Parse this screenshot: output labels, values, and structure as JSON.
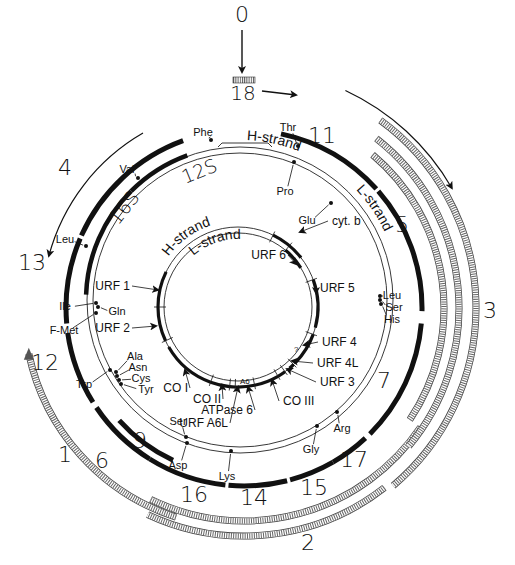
{
  "diagram": {
    "title_marker": "0",
    "origin_label": "18",
    "colors": {
      "ink": "#111111",
      "background": "#ffffff",
      "hatch": "#555555"
    },
    "genome_circle": {
      "center": [
        240,
        300
      ],
      "radii": [
        153,
        147
      ],
      "strand_labels": [
        {
          "text": "H-strand",
          "angle": 28,
          "r": 160
        },
        {
          "text": "L-strand",
          "angle": 72,
          "r": 160
        }
      ]
    },
    "inner_circle": {
      "center": [
        238,
        307
      ],
      "radii": [
        80,
        74
      ],
      "strand_labels": [
        {
          "text": "H-strand",
          "angle": -18,
          "r": 86
        },
        {
          "text": "L-strand",
          "angle": -5,
          "r": 68
        }
      ]
    },
    "rrna_arcs": [
      {
        "name": "12S",
        "from": -45,
        "to": -20
      },
      {
        "name": "16S",
        "from": -88,
        "to": -45
      }
    ],
    "rrna_labels": [
      {
        "text": "12S",
        "x": 185,
        "y": 184,
        "rot": -22
      },
      {
        "text": "16S",
        "x": 118,
        "y": 226,
        "rot": -52
      }
    ],
    "trna_markers": [
      {
        "name": "Phe",
        "x": 211,
        "y": 140,
        "tx": 203,
        "ty": 133
      },
      {
        "name": "Val",
        "x": 138,
        "y": 178,
        "tx": 127,
        "ty": 170
      },
      {
        "name": "Leu",
        "x": 86,
        "y": 246,
        "tx": 65,
        "ty": 240
      },
      {
        "name": "Thr",
        "x": 298,
        "y": 146,
        "tx": 288,
        "ty": 128
      },
      {
        "name": "Pro",
        "x": 294,
        "y": 162,
        "tx": 285,
        "ty": 192
      },
      {
        "name": "Glu",
        "x": 331,
        "y": 203,
        "tx": 307,
        "ty": 221
      },
      {
        "name": "Ile",
        "x": 96,
        "y": 303,
        "tx": 65,
        "ty": 307
      },
      {
        "name": "Gln",
        "x": 98,
        "y": 307,
        "tx": 117,
        "ty": 312
      },
      {
        "name": "F-Met",
        "x": 96,
        "y": 313,
        "tx": 64,
        "ty": 331
      },
      {
        "name": "Trp",
        "x": 110,
        "y": 370,
        "tx": 84,
        "ty": 385
      },
      {
        "name": "Ala",
        "x": 116,
        "y": 372,
        "tx": 135,
        "ty": 357
      },
      {
        "name": "Asn",
        "x": 117,
        "y": 376,
        "tx": 138,
        "ty": 368
      },
      {
        "name": "Cys",
        "x": 119,
        "y": 380,
        "tx": 141,
        "ty": 379
      },
      {
        "name": "Tyr",
        "x": 121,
        "y": 384,
        "tx": 146,
        "ty": 390
      },
      {
        "name": "Ser",
        "x": 186,
        "y": 437,
        "tx": 178,
        "ty": 422
      },
      {
        "name": "Asp",
        "x": 187,
        "y": 443,
        "tx": 178,
        "ty": 466
      },
      {
        "name": "Lys",
        "x": 231,
        "y": 451,
        "tx": 227,
        "ty": 477
      },
      {
        "name": "Gly",
        "x": 317,
        "y": 426,
        "tx": 311,
        "ty": 450
      },
      {
        "name": "Arg",
        "x": 337,
        "y": 412,
        "tx": 342,
        "ty": 429
      },
      {
        "name": "Leu",
        "x": 380,
        "y": 296,
        "tx": 392,
        "ty": 296
      },
      {
        "name": "Ser",
        "x": 380,
        "y": 300,
        "tx": 394,
        "ty": 308
      },
      {
        "name": "His",
        "x": 381,
        "y": 304,
        "tx": 392,
        "ty": 320
      }
    ],
    "inner_genes": [
      {
        "name": "cyt. b",
        "from": 26,
        "to": 52,
        "tx": 332,
        "ty": 225,
        "lx": 300,
        "ly": 232
      },
      {
        "name": "URF 5",
        "from": 70,
        "to": 105,
        "tx": 320,
        "ty": 292,
        "lx": 316,
        "ly": 293
      },
      {
        "name": "URF 4",
        "from": 110,
        "to": 134,
        "tx": 322,
        "ty": 346,
        "lx": 304,
        "ly": 345
      },
      {
        "name": "URF 4L",
        "from": 136,
        "to": 140,
        "tx": 317,
        "ty": 367,
        "lx": 292,
        "ly": 361
      },
      {
        "name": "URF 3",
        "from": 144,
        "to": 150,
        "tx": 320,
        "ty": 386,
        "lx": 287,
        "ly": 369
      },
      {
        "name": "CO III",
        "from": 150,
        "to": 168,
        "tx": 283,
        "ty": 405,
        "lx": 272,
        "ly": 380
      },
      {
        "name": "ATPase 6",
        "from": 168,
        "to": 182,
        "tx": 237,
        "ty": 414,
        "lx": 248,
        "ly": 387
      },
      {
        "name": "URF A6L",
        "from": 182,
        "to": 186,
        "tx": 212,
        "ty": 427,
        "lx": 238,
        "ly": 387
      },
      {
        "name": "CO II",
        "from": 186,
        "to": 200,
        "tx": 205,
        "ty": 403,
        "lx": 222,
        "ly": 385
      },
      {
        "name": "CO I",
        "from": 200,
        "to": 240,
        "tx": 172,
        "ty": 392,
        "lx": 185,
        "ly": 370
      },
      {
        "name": "URF 2",
        "from": 245,
        "to": 270,
        "tx": 114,
        "ty": 332,
        "lx": 156,
        "ly": 326
      },
      {
        "name": "URF 1",
        "from": 270,
        "to": 296,
        "tx": 114,
        "ty": 290,
        "lx": 158,
        "ly": 290
      },
      {
        "name": "URF 6",
        "from": 40,
        "to": 58,
        "tx": 270,
        "ty": 259,
        "lx": 296,
        "ly": 264
      }
    ],
    "small_labels": [
      {
        "text": "A6",
        "x": 240,
        "y": 384
      },
      {
        "text": "?",
        "x": 294,
        "y": 352
      }
    ],
    "transcripts_solid": [
      {
        "label": "4",
        "r": 178,
        "from": -66,
        "to": -20,
        "lx": 65,
        "ly": 175
      },
      {
        "label": "11",
        "r": 178,
        "from": 12,
        "to": 48,
        "lx": 322,
        "ly": 143
      },
      {
        "label": "5",
        "r": 178,
        "from": 49,
        "to": 91,
        "lx": 402,
        "ly": 232
      },
      {
        "label": "7",
        "r": 178,
        "from": 95,
        "to": 135,
        "lx": 384,
        "ly": 388
      },
      {
        "label": "17",
        "r": 178,
        "from": 137,
        "to": 150,
        "lx": 354,
        "ly": 467
      },
      {
        "label": "15",
        "r": 178,
        "from": 150,
        "to": 165,
        "lx": 314,
        "ly": 495
      },
      {
        "label": "14",
        "r": 178,
        "from": 166,
        "to": 185,
        "lx": 254,
        "ly": 505
      },
      {
        "label": "16",
        "r": 178,
        "from": 186,
        "to": 212,
        "lx": 194,
        "ly": 502
      },
      {
        "label": "13",
        "r": 178,
        "from": 265,
        "to": 293,
        "lx": 32,
        "ly": 270
      },
      {
        "label": "12",
        "r": 178,
        "from": 238,
        "to": 262,
        "lx": 45,
        "ly": 370
      },
      {
        "label": "6",
        "r": 178,
        "from": 212,
        "to": 236,
        "lx": 102,
        "ly": 468
      },
      {
        "label": "9",
        "r": 168,
        "from": 205,
        "to": 228,
        "lx": 140,
        "ly": 448
      }
    ],
    "transcripts_hatched": [
      {
        "label": "1",
        "r": 220,
        "from": 198,
        "to": 258,
        "lx": 65,
        "ly": 462,
        "arrow": "end"
      },
      {
        "label": "2",
        "r": 228,
        "from": 142,
        "to": 205,
        "lx": 308,
        "ly": 550,
        "arrow": "none"
      },
      {
        "label": "",
        "r": 213,
        "from": 124,
        "to": 206,
        "lx": 0,
        "ly": 0,
        "arrow": "none"
      },
      {
        "label": "",
        "r": 200,
        "from": 40,
        "to": 124,
        "lx": 0,
        "ly": 0,
        "arrow": "none"
      },
      {
        "label": "",
        "r": 215,
        "from": 38,
        "to": 130,
        "lx": 0,
        "ly": 0,
        "arrow": "none"
      },
      {
        "label": "3",
        "r": 232,
        "from": 36,
        "to": 140,
        "lx": 490,
        "ly": 318,
        "arrow": "none"
      }
    ],
    "direction_arrows": [
      {
        "name": "left-transcription-arrow",
        "r": 202,
        "from": -30,
        "to": -75,
        "head": "end"
      },
      {
        "name": "right-transcription-arrow",
        "r": 240,
        "from": 25,
        "to": 60,
        "head": "end"
      }
    ],
    "origin": {
      "text": "0",
      "x": 242,
      "y": 22,
      "arrow_from": [
        242,
        30
      ],
      "arrow_to": [
        242,
        72
      ],
      "box": [
        233,
        77,
        22,
        6
      ],
      "label": "18",
      "label_x": 243,
      "label_y": 100,
      "side_arrow_from": [
        262,
        91
      ],
      "side_arrow_to": [
        296,
        95
      ]
    }
  }
}
